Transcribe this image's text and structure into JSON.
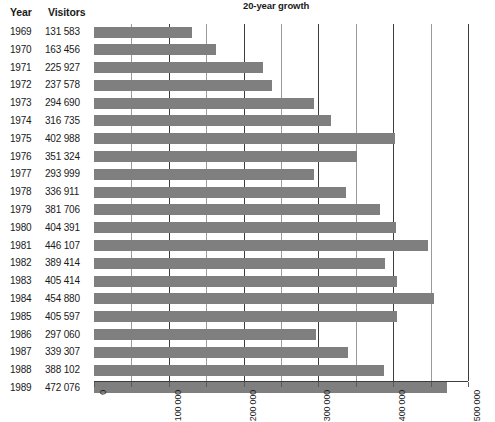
{
  "table": {
    "headers": {
      "year": "Year",
      "visitors": "Visitors"
    }
  },
  "chart_data": {
    "type": "bar",
    "orientation": "horizontal",
    "title": "20-year growth",
    "xlabel": "",
    "ylabel": "",
    "xlim": [
      0,
      500000
    ],
    "grid": true,
    "legend": false,
    "bar_color": "#7f7f7f",
    "major_tick_interval": 100000,
    "minor_tick_interval": 50000,
    "tick_labels": [
      "0",
      "100 000",
      "200 000",
      "300 000",
      "400 000",
      "500 000"
    ],
    "tick_values": [
      0,
      100000,
      200000,
      300000,
      400000,
      500000
    ],
    "categories": [
      "1969",
      "1970",
      "1971",
      "1972",
      "1973",
      "1974",
      "1975",
      "1976",
      "1977",
      "1978",
      "1979",
      "1980",
      "1981",
      "1982",
      "1983",
      "1984",
      "1985",
      "1986",
      "1987",
      "1988",
      "1989"
    ],
    "values": [
      131583,
      163456,
      225927,
      237578,
      294690,
      316735,
      402988,
      351324,
      293999,
      336911,
      381706,
      404391,
      446107,
      389414,
      405414,
      454880,
      405597,
      297060,
      339307,
      388102,
      472076
    ],
    "value_labels": [
      "131 583",
      "163 456",
      "225 927",
      "237 578",
      "294 690",
      "316 735",
      "402 988",
      "351 324",
      "293 999",
      "336 911",
      "381 706",
      "404 391",
      "446 107",
      "389 414",
      "405 414",
      "454 880",
      "405 597",
      "297 060",
      "339 307",
      "388 102",
      "472 076"
    ]
  }
}
